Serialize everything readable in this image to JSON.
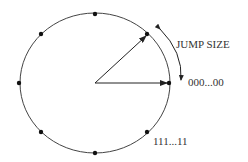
{
  "diagram": {
    "type": "phase-accumulator-wheel",
    "labels": {
      "jump_size": "JUMP SIZE",
      "zero": "000...00",
      "ones": "111...11"
    },
    "circle": {
      "cx": 95,
      "cy": 83,
      "rx": 75,
      "ry": 70
    },
    "dot_count": 8,
    "colors": {
      "stroke": "#222222",
      "text": "#333333",
      "background": "#ffffff"
    }
  }
}
